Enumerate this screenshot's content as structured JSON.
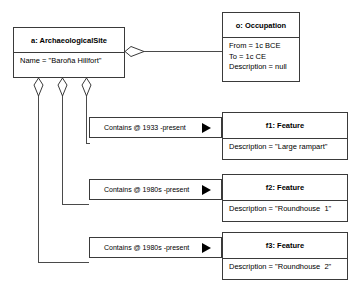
{
  "diagram": {
    "type": "uml-object-diagram",
    "site": {
      "header": "a: ArchaeologicalSite",
      "attributes": [
        "Name = \"Baroña Hillfort\""
      ]
    },
    "occupation": {
      "header": "o: Occupation",
      "attributes": [
        "From = 1c BCE",
        "To = 1c CE",
        "Description = null"
      ]
    },
    "features": [
      {
        "header": "f1: Feature",
        "attributes": [
          "Description = \"Large rampart\""
        ],
        "association": "Contains @ 1933 -present"
      },
      {
        "header": "f2: Feature",
        "attributes": [
          "Description = \"Roundhouse  1\""
        ],
        "association": "Contains @ 1980s -present"
      },
      {
        "header": "f3: Feature",
        "attributes": [
          "Description = \"Roundhouse  2\""
        ],
        "association": "Contains @ 1980s -present"
      }
    ],
    "icons": {
      "aggregation_diamond": "hollow-diamond",
      "navigability_arrow": "filled-right-triangle"
    },
    "colors": {
      "background": "#ffffff",
      "stroke": "#3a3a3a",
      "text": "#000000"
    }
  }
}
